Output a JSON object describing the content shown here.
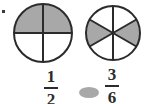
{
  "page": {
    "width": 144,
    "height": 104,
    "background": "#ffffff",
    "corner_mark": "bullet-mark"
  },
  "colors": {
    "shaded": "#a8a8a8",
    "unshaded": "#ffffff",
    "outline": "#2b2b2b",
    "text": "#2b2b2b",
    "operator_blob": "#a8a8a8"
  },
  "figures": [
    {
      "id": "left-circle",
      "name": "fraction-circle-halves",
      "center_x": 43,
      "center_y": 33,
      "radius": 29,
      "total_parts": 4,
      "shaded_parts": 2,
      "division_lines": [
        "vertical",
        "horizontal"
      ],
      "shaded_description": "top half shaded",
      "represents": "1/2"
    },
    {
      "id": "right-circle",
      "name": "fraction-circle-sixths",
      "center_x": 113,
      "center_y": 33,
      "radius": 27,
      "total_parts": 6,
      "shaded_parts": 3,
      "division_lines": [
        "vertical",
        "diagonal-left",
        "diagonal-right"
      ],
      "shaded_description": "left and right side sectors shaded",
      "represents": "3/6"
    }
  ],
  "labels": {
    "left_fraction": {
      "numerator": "1",
      "denominator": "2"
    },
    "right_fraction": {
      "numerator": "3",
      "denominator": "6"
    },
    "comparison_operator": ""
  }
}
